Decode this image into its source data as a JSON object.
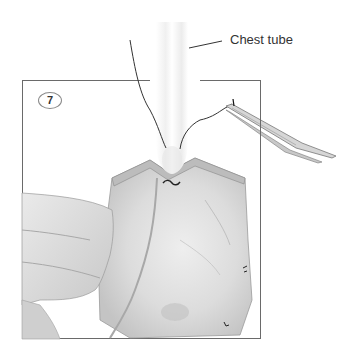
{
  "figure": {
    "step_number": "7",
    "labels": [
      {
        "text": "Chest tube",
        "points_to": "tube"
      }
    ],
    "elements": [
      "chest-tube",
      "suture-thread",
      "needle-holder",
      "hand",
      "tissue-flap",
      "stitch"
    ],
    "colors": {
      "frame": "#6a6a6a",
      "tissue": "#d9d9d9",
      "tissue_shadow": "#b8b8b8",
      "line": "#333333"
    }
  }
}
